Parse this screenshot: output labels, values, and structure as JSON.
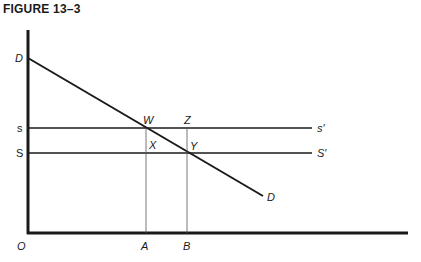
{
  "figure": {
    "title": "FIGURE 13–3"
  },
  "diagram": {
    "type": "supply-demand",
    "axes": {
      "origin_label": "O"
    },
    "curves": {
      "demand": {
        "label_start": "D",
        "label_end": "D"
      },
      "supply_high": {
        "label_left": "s",
        "label_right": "s′"
      },
      "supply_low": {
        "label_left": "S",
        "label_right": "S′"
      }
    },
    "points": {
      "W": "W",
      "Z": "Z",
      "X": "X",
      "Y": "Y"
    },
    "x_ticks": {
      "A": "A",
      "B": "B"
    }
  },
  "colors": {
    "ink": "#1a1a1a",
    "guide": "#555555",
    "background": "#ffffff"
  }
}
